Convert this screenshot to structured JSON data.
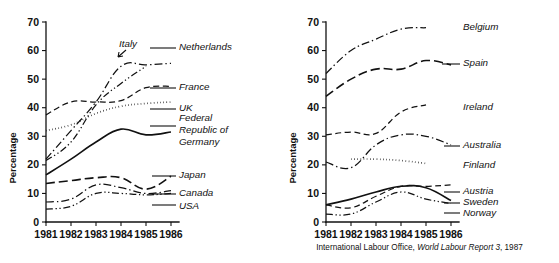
{
  "figure": {
    "source_note_prefix": "International Labour Office,",
    "source_note_italic": "World Labour Report 3",
    "source_note_suffix": ", 1987"
  },
  "axis": {
    "ylabel": "Percentage",
    "yticks": [
      "0",
      "10",
      "20",
      "30",
      "40",
      "50",
      "60",
      "70"
    ],
    "xticks": [
      "1981",
      "1982",
      "1983",
      "1984",
      "1985",
      "1986"
    ]
  },
  "labels": {
    "left": {
      "netherlands": "Netherlands",
      "italy": "Italy",
      "france": "France",
      "uk": "UK",
      "frg_line1": "Federal",
      "frg_line2": "Republic of",
      "frg_line3": "Germany",
      "japan": "Japan",
      "canada": "Canada",
      "usa": "USA"
    },
    "right": {
      "belgium": "Belgium",
      "spain": "Spain",
      "ireland": "Ireland",
      "australia": "Australia",
      "finland": "Finland",
      "austria": "Austria",
      "sweden": "Sweden",
      "norway": "Norway"
    }
  },
  "chart_data": [
    {
      "type": "line",
      "title": "",
      "xlabel": "",
      "ylabel": "Percentage",
      "x": [
        1981,
        1982,
        1983,
        1984,
        1985,
        1986
      ],
      "xlim": [
        1981,
        1986
      ],
      "ylim": [
        0,
        70
      ],
      "grid": false,
      "legend_position": "right-inline",
      "series": [
        {
          "name": "Netherlands",
          "dash": "dash-dot",
          "x": [
            1981,
            1982,
            1983,
            1984,
            1985,
            1986
          ],
          "values": [
            22,
            32,
            42,
            54.5,
            55,
            55.5
          ]
        },
        {
          "name": "Italy",
          "dash": "dash-dot-dot",
          "x": [
            1981,
            1982,
            1983,
            1984,
            1985
          ],
          "values": [
            21.5,
            28,
            41,
            48.5,
            54.5
          ]
        },
        {
          "name": "France",
          "dash": "dashed",
          "x": [
            1981,
            1982,
            1983,
            1984,
            1985,
            1986
          ],
          "values": [
            37.5,
            42,
            42,
            42.5,
            47,
            47.5
          ]
        },
        {
          "name": "UK",
          "dash": "dotted",
          "x": [
            1981,
            1982,
            1983,
            1984,
            1985,
            1986
          ],
          "values": [
            32,
            34,
            38,
            40.5,
            41.5,
            42
          ]
        },
        {
          "name": "Federal Republic of Germany",
          "dash": "solid",
          "x": [
            1981,
            1982,
            1983,
            1984,
            1985,
            1986
          ],
          "values": [
            16.5,
            22,
            28,
            32.5,
            30.5,
            31.5
          ]
        },
        {
          "name": "Japan",
          "dash": "long-dash",
          "x": [
            1981,
            1982,
            1983,
            1984,
            1985,
            1986
          ],
          "values": [
            13.5,
            14.5,
            15.5,
            15.5,
            11.5,
            16
          ]
        },
        {
          "name": "Canada",
          "dash": "dash-dot",
          "x": [
            1981,
            1982,
            1983,
            1984,
            1985,
            1986
          ],
          "values": [
            7,
            8,
            13,
            12,
            10,
            11
          ]
        },
        {
          "name": "USA",
          "dash": "dash-dot-dot",
          "x": [
            1981,
            1982,
            1983,
            1984,
            1985,
            1986
          ],
          "values": [
            4.5,
            5.5,
            10,
            10,
            9.5,
            10
          ]
        }
      ]
    },
    {
      "type": "line",
      "title": "",
      "xlabel": "",
      "ylabel": "Percentage",
      "x": [
        1981,
        1982,
        1983,
        1984,
        1985,
        1986
      ],
      "xlim": [
        1981,
        1986
      ],
      "ylim": [
        0,
        70
      ],
      "grid": false,
      "legend_position": "right-inline",
      "series": [
        {
          "name": "Belgium",
          "dash": "dash-dot",
          "x": [
            1981,
            1982,
            1983,
            1984,
            1985
          ],
          "values": [
            52,
            60,
            64,
            67.5,
            68
          ]
        },
        {
          "name": "Spain",
          "dash": "long-dash",
          "x": [
            1981,
            1982,
            1983,
            1984,
            1985,
            1986
          ],
          "values": [
            44,
            50,
            53.5,
            53.5,
            56.5,
            55
          ]
        },
        {
          "name": "Ireland",
          "dash": "dashed",
          "x": [
            1981,
            1982,
            1983,
            1984,
            1985
          ],
          "values": [
            30.5,
            31.5,
            31,
            38.5,
            41
          ]
        },
        {
          "name": "Australia",
          "dash": "dash-dot",
          "x": [
            1981,
            1982,
            1983,
            1984,
            1985,
            1986
          ],
          "values": [
            21,
            19,
            27,
            30.5,
            30,
            27
          ]
        },
        {
          "name": "Finland",
          "dash": "dotted",
          "x": [
            1982,
            1983,
            1984,
            1985
          ],
          "values": [
            22,
            22,
            21.5,
            20.5
          ]
        },
        {
          "name": "Austria",
          "dash": "dashed",
          "x": [
            1981,
            1982,
            1983,
            1984,
            1985,
            1986
          ],
          "values": [
            6,
            5,
            9,
            12.5,
            12.5,
            13
          ]
        },
        {
          "name": "Sweden",
          "dash": "solid",
          "x": [
            1981,
            1982,
            1983,
            1984,
            1985,
            1986
          ],
          "values": [
            6,
            8,
            10.5,
            12.5,
            12,
            7.5
          ]
        },
        {
          "name": "Norway",
          "dash": "dash-dot-dot",
          "x": [
            1981,
            1982,
            1983,
            1984,
            1985,
            1986
          ],
          "values": [
            2.8,
            2.8,
            7,
            10.5,
            8,
            6.5
          ]
        }
      ]
    }
  ]
}
